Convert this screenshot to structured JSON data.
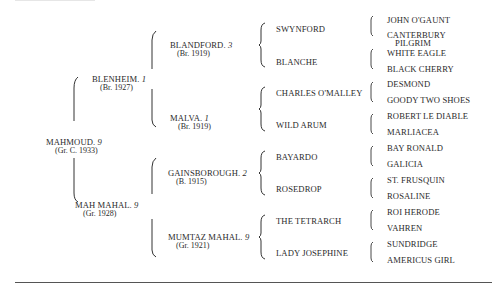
{
  "pedigree": {
    "subject": {
      "name": "MAHMOUD.",
      "family": "9",
      "info": "(Gr. C. 1933)"
    },
    "sire": {
      "name": "BLENHEIM.",
      "family": "1",
      "info": "(Br. 1927)"
    },
    "dam": {
      "name": "MAH MAHAL.",
      "family": "9",
      "info": "(Gr. 1928)"
    },
    "gen2": [
      {
        "name": "BLANDFORD.",
        "family": "3",
        "info": "(Br. 1919)"
      },
      {
        "name": "MALVA.",
        "family": "1",
        "info": "(Br. 1919)"
      },
      {
        "name": "GAINSBOROUGH.",
        "family": "2",
        "info": "(B. 1915)"
      },
      {
        "name": "MUMTAZ MAHAL.",
        "family": "9",
        "info": "(Gr. 1921)"
      }
    ],
    "gen3": [
      "SWYNFORD",
      "BLANCHE",
      "CHARLES O'MALLEY",
      "WILD ARUM",
      "BAYARDO",
      "ROSEDROP",
      "THE TETRARCH",
      "LADY JOSEPHINE"
    ],
    "gen4": [
      "JOHN O'GAUNT",
      "CANTERBURY",
      "PILGRIM",
      "WHITE EAGLE",
      "BLACK CHERRY",
      "DESMOND",
      "GOODY TWO SHOES",
      "ROBERT LE DIABLE",
      "MARLIACEA",
      "BAY RONALD",
      "GALICIA",
      "ST. FRUSQUIN",
      "ROSALINE",
      "ROI HERODE",
      "VAHREN",
      "SUNDRIDGE",
      "AMERICUS GIRL"
    ]
  }
}
